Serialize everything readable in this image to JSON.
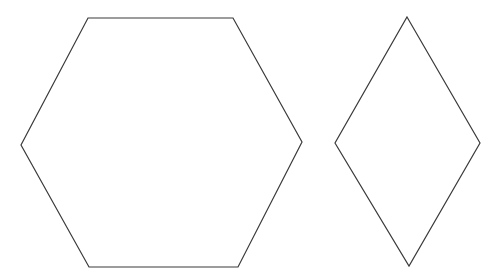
{
  "canvas": {
    "width": 503,
    "height": 279,
    "background": "#ffffff"
  },
  "shapes": [
    {
      "name": "hexagon",
      "points": "88,18 233,18 302,142 238,267 89,267 21,145",
      "stroke": "#3a3a3a"
    },
    {
      "name": "rhombus",
      "points": "407,17 480,143 409,266 335,143",
      "stroke": "#3a3a3a"
    }
  ]
}
